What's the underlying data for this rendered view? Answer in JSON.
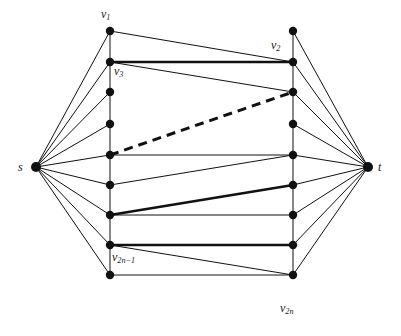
{
  "figure": {
    "type": "graph-diagram",
    "background": "#ffffff",
    "ink_color": "#111111",
    "canvas": {
      "width": 401,
      "height": 336
    },
    "node_radius_terminal": 5.0,
    "node_radius_inner": 4.2,
    "stroke_thin": 1.0,
    "stroke_bold": 2.6,
    "stroke_dashed": 3.0,
    "dash_pattern": "9 6"
  },
  "nodes": {
    "source": {
      "id": "s",
      "x": 36,
      "y": 167,
      "label": "s"
    },
    "sink": {
      "id": "t",
      "x": 368,
      "y": 167,
      "label": "t"
    },
    "left_column_x": 110,
    "right_column_x": 293,
    "rows_y": [
      31,
      62,
      92,
      124,
      155,
      185,
      215,
      245,
      275
    ],
    "left": [
      {
        "id": "L0",
        "x": 110,
        "y": 31
      },
      {
        "id": "L1",
        "x": 110,
        "y": 62
      },
      {
        "id": "L2",
        "x": 110,
        "y": 92
      },
      {
        "id": "L3",
        "x": 110,
        "y": 124
      },
      {
        "id": "L4",
        "x": 110,
        "y": 155
      },
      {
        "id": "L5",
        "x": 110,
        "y": 185
      },
      {
        "id": "L6",
        "x": 110,
        "y": 215
      },
      {
        "id": "L7",
        "x": 110,
        "y": 245
      },
      {
        "id": "L8",
        "x": 110,
        "y": 275
      }
    ],
    "right": [
      {
        "id": "R0",
        "x": 293,
        "y": 31
      },
      {
        "id": "R1",
        "x": 293,
        "y": 62
      },
      {
        "id": "R2",
        "x": 293,
        "y": 92
      },
      {
        "id": "R3",
        "x": 293,
        "y": 124
      },
      {
        "id": "R4",
        "x": 293,
        "y": 155
      },
      {
        "id": "R5",
        "x": 293,
        "y": 185
      },
      {
        "id": "R6",
        "x": 293,
        "y": 215
      },
      {
        "id": "R7",
        "x": 293,
        "y": 245
      },
      {
        "id": "R8",
        "x": 293,
        "y": 275
      }
    ]
  },
  "labels": {
    "s": {
      "text": "s",
      "x": 18,
      "y": 161
    },
    "t": {
      "text": "t",
      "x": 378,
      "y": 161
    },
    "v1": {
      "base": "v",
      "sub": "1",
      "x": 101,
      "y": 8
    },
    "v2": {
      "base": "v",
      "sub": "2",
      "x": 271,
      "y": 39
    },
    "v3": {
      "base": "v",
      "sub": "3",
      "x": 114,
      "y": 65
    },
    "v2n_minus_1": {
      "base": "v",
      "sub": "2n−1",
      "x": 112,
      "y": 251
    },
    "v2n": {
      "base": "v",
      "sub": "2n",
      "x": 280,
      "y": 302
    }
  },
  "edges": {
    "source_fan": [
      {
        "from": "s",
        "to": "L0",
        "style": "thin"
      },
      {
        "from": "s",
        "to": "L1",
        "style": "thin"
      },
      {
        "from": "s",
        "to": "L2",
        "style": "thin"
      },
      {
        "from": "s",
        "to": "L3",
        "style": "thin"
      },
      {
        "from": "s",
        "to": "L4",
        "style": "thin"
      },
      {
        "from": "s",
        "to": "L5",
        "style": "thin"
      },
      {
        "from": "s",
        "to": "L6",
        "style": "thin"
      },
      {
        "from": "s",
        "to": "L7",
        "style": "thin"
      },
      {
        "from": "s",
        "to": "L8",
        "style": "thin"
      }
    ],
    "sink_fan": [
      {
        "from": "R0",
        "to": "t",
        "style": "thin"
      },
      {
        "from": "R1",
        "to": "t",
        "style": "thin"
      },
      {
        "from": "R2",
        "to": "t",
        "style": "thin"
      },
      {
        "from": "R3",
        "to": "t",
        "style": "thin"
      },
      {
        "from": "R4",
        "to": "t",
        "style": "thin"
      },
      {
        "from": "R5",
        "to": "t",
        "style": "thin"
      },
      {
        "from": "R6",
        "to": "t",
        "style": "thin"
      },
      {
        "from": "R7",
        "to": "t",
        "style": "thin"
      },
      {
        "from": "R8",
        "to": "t",
        "style": "thin"
      }
    ],
    "left_spine": [
      {
        "from": "L0",
        "to": "L1",
        "style": "thin"
      },
      {
        "from": "L1",
        "to": "L2",
        "style": "thin"
      },
      {
        "from": "L2",
        "to": "L3",
        "style": "thin"
      },
      {
        "from": "L3",
        "to": "L4",
        "style": "thin"
      },
      {
        "from": "L4",
        "to": "L5",
        "style": "thin"
      },
      {
        "from": "L5",
        "to": "L6",
        "style": "thin"
      },
      {
        "from": "L6",
        "to": "L7",
        "style": "thin"
      },
      {
        "from": "L7",
        "to": "L8",
        "style": "thin"
      }
    ],
    "right_spine": [
      {
        "from": "R0",
        "to": "R1",
        "style": "thin"
      },
      {
        "from": "R1",
        "to": "R2",
        "style": "thin"
      },
      {
        "from": "R2",
        "to": "R3",
        "style": "thin"
      },
      {
        "from": "R3",
        "to": "R4",
        "style": "thin"
      },
      {
        "from": "R4",
        "to": "R5",
        "style": "thin"
      },
      {
        "from": "R5",
        "to": "R6",
        "style": "thin"
      },
      {
        "from": "R6",
        "to": "R7",
        "style": "thin"
      },
      {
        "from": "R7",
        "to": "R8",
        "style": "thin"
      }
    ],
    "cross": [
      {
        "from": "L0",
        "to": "R1",
        "style": "thin"
      },
      {
        "from": "L1",
        "to": "R1",
        "style": "bold"
      },
      {
        "from": "L1",
        "to": "R2",
        "style": "thin"
      },
      {
        "from": "L4",
        "to": "R2",
        "style": "bold-dashed"
      },
      {
        "from": "L4",
        "to": "R4",
        "style": "thin"
      },
      {
        "from": "L5",
        "to": "R4",
        "style": "thin"
      },
      {
        "from": "L6",
        "to": "R5",
        "style": "bold"
      },
      {
        "from": "L6",
        "to": "R6",
        "style": "thin"
      },
      {
        "from": "L7",
        "to": "R7",
        "style": "bold"
      },
      {
        "from": "L7",
        "to": "R8",
        "style": "thin"
      },
      {
        "from": "L8",
        "to": "R8",
        "style": "thin"
      }
    ]
  }
}
